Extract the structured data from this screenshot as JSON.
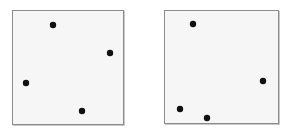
{
  "diagram": {
    "colors": {
      "background": "#ffffff",
      "panel_fill": "#f6f6f6",
      "panel_border": "#8c8c8c",
      "dot": "#111111"
    },
    "dot_radius": 3.2,
    "panels": [
      {
        "id": "left",
        "box": {
          "x": 12,
          "y": 10,
          "w": 112,
          "h": 115
        },
        "points": [
          {
            "x": 53,
            "y": 25
          },
          {
            "x": 110,
            "y": 53
          },
          {
            "x": 26,
            "y": 83
          },
          {
            "x": 82,
            "y": 111
          }
        ]
      },
      {
        "id": "right",
        "box": {
          "x": 164,
          "y": 10,
          "w": 115,
          "h": 114
        },
        "points": [
          {
            "x": 193,
            "y": 24
          },
          {
            "x": 263,
            "y": 81
          },
          {
            "x": 180,
            "y": 109
          },
          {
            "x": 207,
            "y": 118
          }
        ]
      }
    ]
  }
}
